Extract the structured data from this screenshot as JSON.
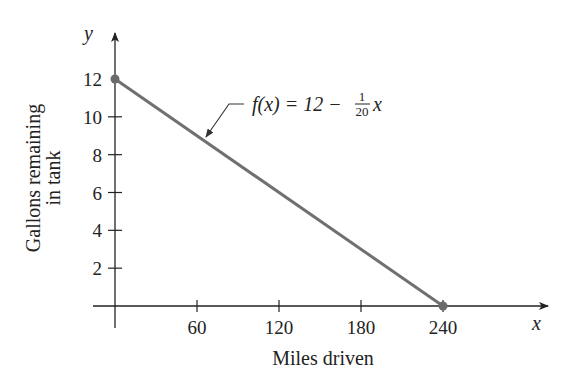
{
  "chart_data": {
    "type": "line",
    "title": "",
    "xlabel": "Miles driven",
    "ylabel_lines": [
      "Gallons remaining",
      "in tank"
    ],
    "ylabel": "Gallons remaining in tank",
    "x_axis_var": "x",
    "y_axis_var": "y",
    "x_ticks": [
      60,
      120,
      180,
      240
    ],
    "x_tick_labels": [
      "60",
      "120",
      "180",
      "240"
    ],
    "y_ticks": [
      2,
      4,
      6,
      8,
      10,
      12
    ],
    "y_tick_labels": [
      "2",
      "4",
      "6",
      "8",
      "10",
      "12"
    ],
    "xlim": [
      0,
      310
    ],
    "ylim": [
      0,
      14
    ],
    "grid": false,
    "legend": null,
    "series": [
      {
        "name": "f(x) = 12 − (1/20)x",
        "x": [
          0,
          240
        ],
        "y": [
          12,
          0
        ],
        "color": "#707070",
        "markers": "endpoints"
      }
    ],
    "annotations": [
      {
        "text": "f(x) = 12 − (1/20)x",
        "parts": {
          "lhs": "f(x) = 12 − ",
          "frac_num": "1",
          "frac_den": "20",
          "var": "x"
        },
        "points_to": [
          60,
          9
        ]
      }
    ]
  },
  "colors": {
    "line": "#707070",
    "axis": "#222222",
    "marker": "#6a6a6a"
  }
}
